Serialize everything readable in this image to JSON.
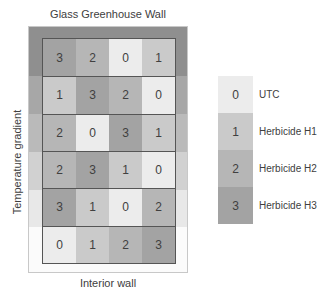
{
  "labels": {
    "top": "Glass Greenhouse Wall",
    "bottom": "Interior wall",
    "side": "Temperature gradient"
  },
  "colors": {
    "levels": [
      "#ececec",
      "#cacaca",
      "#b6b6b6",
      "#a3a3a3"
    ],
    "gradient_bands": [
      "#8f8f8f",
      "#a7a7a7",
      "#bababa",
      "#d1d1d1",
      "#e8e8e8",
      "#fbfbfb"
    ]
  },
  "grid": {
    "rows": [
      [
        3,
        2,
        0,
        1
      ],
      [
        1,
        3,
        2,
        0
      ],
      [
        2,
        0,
        3,
        1
      ],
      [
        2,
        3,
        1,
        0
      ],
      [
        3,
        1,
        0,
        2
      ],
      [
        0,
        1,
        2,
        3
      ]
    ]
  },
  "legend": [
    {
      "code": "0",
      "label": "UTC"
    },
    {
      "code": "1",
      "label": "Herbicide H1"
    },
    {
      "code": "2",
      "label": "Herbicide H2"
    },
    {
      "code": "3",
      "label": "Herbicide H3"
    }
  ]
}
